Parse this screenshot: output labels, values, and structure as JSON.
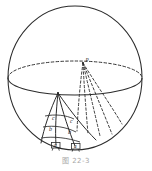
{
  "figure": {
    "caption": "图 22-3",
    "ink_color": "#2b2b2b",
    "faint_color": "#8d8d8d",
    "background": "#ffffff"
  },
  "sphere": {
    "name": "great-circle-outline",
    "center_x": 75,
    "center_y": 78,
    "radius_x": 67,
    "radius_y": 72,
    "top_y": 6,
    "bottom_y": 150,
    "left_x": 8,
    "right_x": 142
  },
  "equator": {
    "name": "equator-ellipse",
    "center_x": 75,
    "center_y": 78,
    "radius_x": 67,
    "radius_y": 17,
    "front_style": "solid",
    "back_style": "dashed"
  },
  "pole": {
    "label": "P",
    "x": 83,
    "y": 63,
    "note": "projection point on far side of equator"
  },
  "apex": {
    "label": "",
    "x": 58,
    "y": 93,
    "note": "near-side vertex where solid meridians converge"
  },
  "meridians": {
    "solid_count": 4,
    "dashed_count": 5,
    "solid_label": "front meridian arcs",
    "dashed_label": "back meridian arcs"
  },
  "cells": [
    {
      "name": "cell-left",
      "labels": [
        "c",
        "b",
        "a"
      ]
    },
    {
      "name": "cell-right",
      "labels": [
        "c",
        "b",
        "a"
      ]
    }
  ],
  "labels": {
    "c_left": {
      "text": "c",
      "x": 52,
      "y": 120
    },
    "b_left": {
      "text": "b",
      "x": 49,
      "y": 131
    },
    "a_left": {
      "text": "a",
      "x": 56,
      "y": 146
    },
    "c_right": {
      "text": "c",
      "x": 70,
      "y": 123
    },
    "b_right": {
      "text": "b",
      "x": 68,
      "y": 134
    },
    "a_right": {
      "text": "a",
      "x": 76,
      "y": 147
    }
  }
}
